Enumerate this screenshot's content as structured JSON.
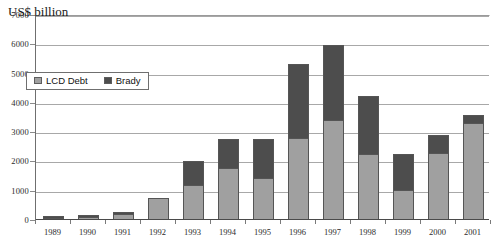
{
  "chart_data": {
    "type": "bar",
    "title": "US$ billion",
    "xlabel": "",
    "ylabel": "",
    "ylim": [
      0,
      7000
    ],
    "ytick_step": 1000,
    "yticks": [
      "7000",
      "6000",
      "5000",
      "4000",
      "3000",
      "2000",
      "1000",
      "0"
    ],
    "grid": true,
    "stacked": true,
    "legend_position": "inside-upper-left",
    "categories": [
      "1989",
      "1990",
      "1991",
      "1992",
      "1993",
      "1994",
      "1995",
      "1996",
      "1997",
      "1998",
      "1999",
      "2000",
      "2001"
    ],
    "series": [
      {
        "name": "LCD Debt",
        "color": "#a0a0a0",
        "values": [
          50,
          100,
          220,
          760,
          1200,
          1780,
          1420,
          2800,
          3400,
          2270,
          1020,
          2290,
          3300
        ]
      },
      {
        "name": "Brady",
        "color": "#4d4d4d",
        "values": [
          10,
          20,
          20,
          0,
          800,
          970,
          1360,
          2530,
          2580,
          1960,
          1220,
          620,
          290
        ]
      }
    ],
    "totals": [
      60,
      120,
      240,
      760,
      2000,
      2750,
      2780,
      5330,
      5980,
      4230,
      2240,
      2910,
      3590
    ]
  },
  "legend": {
    "items": [
      {
        "label": "LCD Debt",
        "color": "#a0a0a0"
      },
      {
        "label": "Brady",
        "color": "#4d4d4d"
      }
    ]
  },
  "colors": {
    "lcd_debt": "#a0a0a0",
    "brady": "#4d4d4d",
    "axis": "#6f6f6f",
    "grid": "#a8a8a8",
    "text": "#2b2b2b",
    "background": "#ffffff"
  }
}
